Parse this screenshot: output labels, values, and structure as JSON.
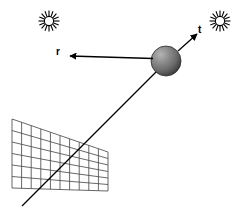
{
  "figure": {
    "background_color": "#ffffff",
    "stroke_color": "#000000",
    "width": 249,
    "height": 218
  },
  "labels": {
    "reflected_vector": "r",
    "transmitted_vector": "t"
  },
  "icons": {
    "light_source_left": "sun-icon",
    "light_source_right": "sun-icon",
    "sphere": "shaded-sphere-icon",
    "grid": "image-plane-grid-icon",
    "incoming_ray": "incoming-ray-icon",
    "reflected_ray": "reflected-ray-icon",
    "transmitted_ray": "transmitted-ray-icon"
  },
  "geometry": {
    "sphere": {
      "cx": 166,
      "cy": 61,
      "r": 15
    },
    "sun_left": {
      "cx": 49,
      "cy": 21,
      "r_inner": 5,
      "r_outer": 10,
      "rays": 16
    },
    "sun_right": {
      "cx": 220,
      "cy": 21,
      "r_inner": 5,
      "r_outer": 10,
      "rays": 16
    },
    "incoming_ray": {
      "x1": 22,
      "y1": 206,
      "x2": 162,
      "y2": 66
    },
    "reflected_ray": {
      "x1": 152,
      "y1": 58,
      "x2": 72,
      "y2": 56
    },
    "transmitted_ray": {
      "x1": 178,
      "y1": 52,
      "x2": 196,
      "y2": 35
    },
    "grid": {
      "top_left": [
        12,
        119
      ],
      "top_right": [
        108,
        152
      ],
      "bottom_right": [
        108,
        191
      ],
      "bottom_left": [
        12,
        188
      ],
      "columns": 10,
      "rows": 6
    },
    "label_r": {
      "x": 59,
      "y": 55
    },
    "label_t": {
      "x": 199,
      "y": 33
    }
  },
  "colors": {
    "ink": "#000000",
    "sphere_light": "#9a9a9a",
    "sphere_mid": "#7a7a7a",
    "sphere_dark": "#3c3c3c",
    "grid_line": "#5a5a5a",
    "paper": "#ffffff"
  }
}
